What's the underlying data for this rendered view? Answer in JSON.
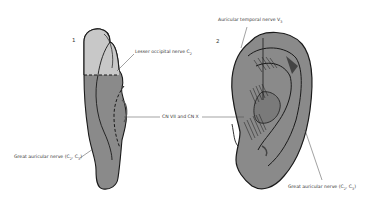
{
  "figure": {
    "panels": [
      {
        "number": "1",
        "view": "posterior ear (medial surface)"
      },
      {
        "number": "2",
        "view": "lateral ear"
      }
    ],
    "labels": {
      "lesser_occipital": {
        "text": "Lesser occipital nerve C",
        "sub": "2"
      },
      "cn_vii_x": {
        "text": "CN VII and CN X"
      },
      "great_auricular_left": {
        "text": "Great auricular nerve (C",
        "sub1": "2",
        "sep": ", C",
        "sub2": "3",
        "end": ")"
      },
      "auriculotemporal": {
        "text": "Auricular temporal nerve V",
        "sub": "3"
      },
      "great_auricular_right": {
        "text": "Great auricular nerve (C",
        "sub1": "2",
        "sep": ", C",
        "sub2": "3",
        "end": ")"
      }
    },
    "colors": {
      "light_region": "#c8c8c8",
      "dark_region": "#8a8a8a",
      "outline": "#1a1a1a",
      "background": "#ffffff"
    }
  }
}
